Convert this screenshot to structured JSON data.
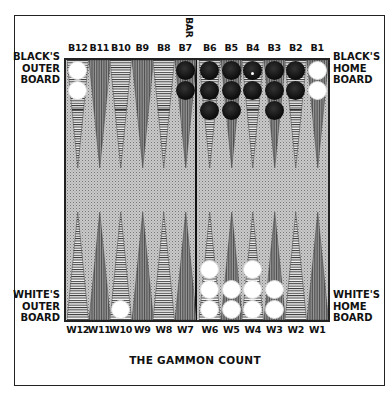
{
  "diagram": {
    "title": "THE GAMMON COUNT",
    "bar_label": "BAR",
    "side_labels": {
      "black_outer": [
        "BLACK'S",
        "OUTER",
        "BOARD"
      ],
      "black_home": [
        "BLACK'S",
        "HOME",
        "BOARD"
      ],
      "white_outer": [
        "WHITE'S",
        "OUTER",
        "BOARD"
      ],
      "white_home": [
        "WHITE'S",
        "HOME",
        "BOARD"
      ]
    },
    "top_points": [
      {
        "label": "B12",
        "checkers": 2,
        "color": "white"
      },
      {
        "label": "B11",
        "checkers": 0,
        "color": ""
      },
      {
        "label": "B10",
        "checkers": 0,
        "color": ""
      },
      {
        "label": "B9",
        "checkers": 0,
        "color": ""
      },
      {
        "label": "B8",
        "checkers": 0,
        "color": ""
      },
      {
        "label": "B7",
        "checkers": 2,
        "color": "black"
      },
      {
        "label": "B6",
        "checkers": 3,
        "color": "black"
      },
      {
        "label": "B5",
        "checkers": 3,
        "color": "black"
      },
      {
        "label": "B4",
        "checkers": 2,
        "color": "black"
      },
      {
        "label": "B3",
        "checkers": 3,
        "color": "black"
      },
      {
        "label": "B2",
        "checkers": 2,
        "color": "black"
      },
      {
        "label": "B1",
        "checkers": 2,
        "color": "white"
      }
    ],
    "bottom_points": [
      {
        "label": "W12",
        "checkers": 0,
        "color": ""
      },
      {
        "label": "W11",
        "checkers": 0,
        "color": ""
      },
      {
        "label": "W10",
        "checkers": 1,
        "color": "white"
      },
      {
        "label": "W9",
        "checkers": 0,
        "color": ""
      },
      {
        "label": "W8",
        "checkers": 0,
        "color": ""
      },
      {
        "label": "W7",
        "checkers": 0,
        "color": ""
      },
      {
        "label": "W6",
        "checkers": 3,
        "color": "white"
      },
      {
        "label": "W5",
        "checkers": 2,
        "color": "white"
      },
      {
        "label": "W4",
        "checkers": 3,
        "color": "white"
      },
      {
        "label": "W3",
        "checkers": 2,
        "color": "white"
      },
      {
        "label": "W2",
        "checkers": 0,
        "color": ""
      },
      {
        "label": "W1",
        "checkers": 0,
        "color": ""
      }
    ],
    "colors": {
      "board_background": "#c9c9c9",
      "frame": "#222222",
      "black_checker": "#111111",
      "white_checker": "#ffffff"
    }
  }
}
